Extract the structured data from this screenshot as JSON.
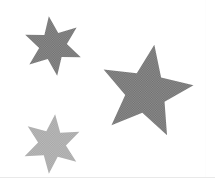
{
  "canvas": {
    "width": 215,
    "height": 183,
    "background_color": "#ffffff",
    "title": "Three gray stars on white background"
  },
  "palette": {
    "background": "#ffffff",
    "star_medium_gray": "#8f8f8f",
    "star_light_gray": "#b0b0b0",
    "rule_line": "#e9e9e9",
    "halftone_dark": "#6e6e6e",
    "halftone_light": "#a5a5a5"
  },
  "shapes": [
    {
      "id": "star-top-left",
      "name": "six-point-star-top-left",
      "type": "star",
      "points": 6,
      "fill": "#8f8f8f",
      "texture": "halftone-dither",
      "center_x": 53,
      "center_y": 46,
      "outer_radius": 30,
      "inner_radius": 14,
      "rotation_deg": -8,
      "bounds": {
        "x": 23,
        "y": 17,
        "width": 59,
        "height": 58
      },
      "label": "Small six-pointed star, medium gray"
    },
    {
      "id": "star-right",
      "name": "five-point-star-right",
      "type": "star",
      "points": 5,
      "fill": "#8f8f8f",
      "texture": "halftone-dither",
      "center_x": 146,
      "center_y": 92,
      "outer_radius": 48,
      "inner_radius": 21,
      "rotation_deg": 10,
      "bounds": {
        "x": 100,
        "y": 45,
        "width": 90,
        "height": 88
      },
      "label": "Large five-pointed star, medium gray"
    },
    {
      "id": "star-bottom-left",
      "name": "six-point-star-bottom-left",
      "type": "star",
      "points": 6,
      "fill": "#b0b0b0",
      "texture": "halftone-dither",
      "center_x": 52,
      "center_y": 144,
      "outer_radius": 30,
      "inner_radius": 14,
      "rotation_deg": 6,
      "bounds": {
        "x": 24,
        "y": 114,
        "width": 56,
        "height": 59
      },
      "label": "Small six-pointed star, light gray"
    }
  ],
  "rules": {
    "bottom_rule_color": "#e9e9e9",
    "bottom_rule_y": 177,
    "right_rule_color": "#fdfdfd",
    "right_rule_x": 205
  }
}
